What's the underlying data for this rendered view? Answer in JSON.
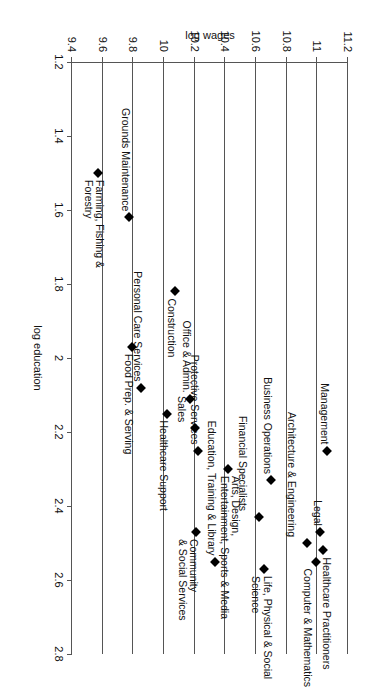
{
  "chart_data": {
    "type": "scatter",
    "title": "",
    "xlabel": "log education",
    "ylabel": "log wages",
    "xlim": [
      1.2,
      2.8
    ],
    "ylim": [
      9.4,
      11.2
    ],
    "xticks": [
      "1.2",
      "1.4",
      "1.6",
      "1.8",
      "2",
      "2.2",
      "2.4",
      "2.6",
      "2.8"
    ],
    "yticks": [
      "9.4",
      "9.6",
      "9.8",
      "10",
      "10.2",
      "10.4",
      "10.6",
      "10.8",
      "11",
      "11.2"
    ],
    "grid": "vertical-gridlines-only",
    "legend": "none",
    "marker": "filled-black-diamond",
    "points": [
      {
        "label": "Management",
        "x": 2.25,
        "y": 11.06,
        "lx": -6,
        "ly": -3,
        "align": "right"
      },
      {
        "label": "Legal",
        "x": 2.47,
        "y": 11.02,
        "lx": -6,
        "ly": -3,
        "align": "right"
      },
      {
        "label": "Healthcare Practitioners",
        "x": 2.52,
        "y": 11.04,
        "lx": 7,
        "ly": -9,
        "align": "left"
      },
      {
        "label": "Computer & Mathematics",
        "x": 2.55,
        "y": 10.99,
        "lx": 7,
        "ly": 3,
        "align": "left"
      },
      {
        "label": "Architecture & Engineering",
        "x": 2.5,
        "y": 10.93,
        "lx": -6,
        "ly": 10,
        "align": "right"
      },
      {
        "label": "Business Operations",
        "x": 2.33,
        "y": 10.7,
        "lx": -6,
        "ly": -2,
        "align": "right"
      },
      {
        "label": "Life, Physical & Social\nScience",
        "x": 2.57,
        "y": 10.65,
        "lx": 7,
        "ly": -9,
        "align": "left"
      },
      {
        "label": "Financial Specialists",
        "x": 2.43,
        "y": 10.62,
        "lx": -6,
        "ly": 11,
        "align": "right"
      },
      {
        "label": "Arts, Design,\nEntertainment, Sports & Media",
        "x": 2.3,
        "y": 10.42,
        "lx": 7,
        "ly": -13,
        "align": "left"
      },
      {
        "label": "Education, Training & Library",
        "x": 2.55,
        "y": 10.33,
        "lx": -6,
        "ly": -2,
        "align": "right"
      },
      {
        "label": "Protective Services",
        "x": 2.25,
        "y": 10.22,
        "lx": -6,
        "ly": -2,
        "align": "right"
      },
      {
        "label": "Community\n& Social Services",
        "x": 2.47,
        "y": 10.21,
        "lx": 7,
        "ly": -3,
        "align": "left"
      },
      {
        "label": "Sales",
        "x": 2.19,
        "y": 10.2,
        "lx": -6,
        "ly": 8,
        "align": "right"
      },
      {
        "label": "Office & Admin.",
        "x": 2.11,
        "y": 10.17,
        "lx": -6,
        "ly": -2,
        "align": "right"
      },
      {
        "label": "Healthcare Support",
        "x": 2.15,
        "y": 10.02,
        "lx": 7,
        "ly": -2,
        "align": "left"
      },
      {
        "label": "Construction",
        "x": 1.82,
        "y": 10.07,
        "lx": 7,
        "ly": -2,
        "align": "left"
      },
      {
        "label": "Personal Care Services",
        "x": 2.08,
        "y": 9.85,
        "lx": -6,
        "ly": -2,
        "align": "right"
      },
      {
        "label": "Food Prep. & Serving",
        "x": 1.97,
        "y": 9.79,
        "lx": 7,
        "ly": -2,
        "align": "left"
      },
      {
        "label": "Grounds Maintenance",
        "x": 1.62,
        "y": 9.77,
        "lx": -6,
        "ly": -2,
        "align": "right"
      },
      {
        "label": "Farming, Fishing &\nForestry",
        "x": 1.5,
        "y": 9.57,
        "lx": 7,
        "ly": -7,
        "align": "left"
      }
    ]
  }
}
